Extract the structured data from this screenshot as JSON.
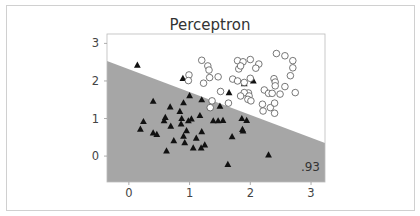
{
  "chart_data": {
    "type": "scatter",
    "title": "Perceptron",
    "xlabel": "",
    "ylabel": "",
    "xlim": [
      -0.36,
      3.23
    ],
    "ylim": [
      -0.69,
      3.25
    ],
    "xticks": [
      "0",
      "1",
      "2",
      "3"
    ],
    "yticks": [
      "0",
      "1",
      "2",
      "3"
    ],
    "grid": false,
    "legend": null,
    "annotation": ".93",
    "decision_boundary": {
      "x": [
        -0.36,
        3.23
      ],
      "y": [
        2.53,
        0.35
      ]
    },
    "regions": {
      "below_color": "#a6a6a6",
      "above_color": "#ffffff"
    },
    "series": [
      {
        "name": "class 0",
        "marker": "triangle",
        "color": "#111111",
        "points": [
          [
            0.14,
            2.42
          ],
          [
            0.89,
            2.07
          ],
          [
            2.05,
            2.0
          ],
          [
            1.9,
            1.93
          ],
          [
            1.65,
            1.69
          ],
          [
            1.0,
            1.61
          ],
          [
            1.2,
            1.5
          ],
          [
            1.5,
            1.33
          ],
          [
            0.4,
            1.46
          ],
          [
            0.68,
            1.31
          ],
          [
            0.9,
            1.42
          ],
          [
            0.84,
            1.19
          ],
          [
            0.6,
            1.03
          ],
          [
            0.58,
            0.94
          ],
          [
            0.69,
            0.8
          ],
          [
            0.87,
            1.0
          ],
          [
            0.86,
            0.86
          ],
          [
            0.98,
            0.94
          ],
          [
            1.03,
            0.99
          ],
          [
            1.17,
            1.08
          ],
          [
            0.24,
            0.92
          ],
          [
            0.19,
            0.72
          ],
          [
            0.4,
            0.62
          ],
          [
            0.46,
            0.58
          ],
          [
            0.62,
            0.14
          ],
          [
            0.74,
            0.41
          ],
          [
            0.9,
            0.53
          ],
          [
            0.95,
            0.68
          ],
          [
            0.92,
            0.36
          ],
          [
            1.06,
            0.22
          ],
          [
            1.11,
            0.48
          ],
          [
            1.2,
            0.65
          ],
          [
            1.25,
            0.3
          ],
          [
            1.19,
            0.22
          ],
          [
            1.39,
            0.94
          ],
          [
            1.47,
            0.94
          ],
          [
            1.55,
            0.95
          ],
          [
            1.86,
            1.0
          ],
          [
            1.94,
            0.95
          ],
          [
            1.87,
            0.71
          ],
          [
            1.88,
            0.67
          ],
          [
            1.7,
            0.52
          ],
          [
            2.3,
            0.03
          ],
          [
            1.63,
            -0.22
          ]
        ]
      },
      {
        "name": "class 1",
        "marker": "circle",
        "color": "#ffffff",
        "points": [
          [
            1.2,
            2.55
          ],
          [
            1.3,
            2.4
          ],
          [
            1.32,
            2.29
          ],
          [
            1.33,
            2.09
          ],
          [
            1.47,
            2.11
          ],
          [
            0.99,
            2.16
          ],
          [
            0.98,
            2.01
          ],
          [
            1.23,
            1.94
          ],
          [
            1.51,
            1.72
          ],
          [
            1.37,
            1.47
          ],
          [
            1.34,
            1.29
          ],
          [
            1.64,
            1.41
          ],
          [
            1.71,
            2.05
          ],
          [
            1.79,
            2.0
          ],
          [
            1.9,
            1.96
          ],
          [
            2.0,
            2.07
          ],
          [
            2.0,
            2.57
          ],
          [
            1.79,
            2.54
          ],
          [
            1.88,
            2.51
          ],
          [
            1.81,
            2.32
          ],
          [
            1.84,
            2.4
          ],
          [
            2.14,
            2.45
          ],
          [
            2.09,
            2.34
          ],
          [
            2.43,
            2.73
          ],
          [
            2.57,
            2.67
          ],
          [
            2.7,
            2.54
          ],
          [
            2.7,
            2.35
          ],
          [
            2.66,
            2.14
          ],
          [
            2.57,
            1.85
          ],
          [
            2.39,
            2.06
          ],
          [
            2.41,
            1.97
          ],
          [
            2.41,
            1.87
          ],
          [
            2.23,
            1.76
          ],
          [
            2.3,
            1.67
          ],
          [
            2.36,
            1.67
          ],
          [
            2.49,
            1.65
          ],
          [
            2.74,
            1.69
          ],
          [
            1.97,
            1.68
          ],
          [
            1.9,
            1.69
          ],
          [
            1.84,
            1.6
          ],
          [
            1.98,
            1.6
          ],
          [
            1.96,
            1.51
          ],
          [
            2.01,
            1.47
          ],
          [
            2.2,
            1.38
          ],
          [
            2.21,
            1.2
          ],
          [
            2.33,
            1.29
          ],
          [
            2.4,
            1.41
          ],
          [
            2.4,
            1.14
          ]
        ]
      }
    ]
  }
}
